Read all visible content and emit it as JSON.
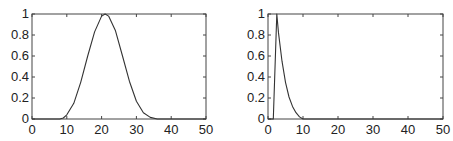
{
  "chart_data": [
    {
      "type": "line",
      "title": "",
      "xlabel": "",
      "ylabel": "",
      "xlim": [
        0,
        50
      ],
      "ylim": [
        0,
        1
      ],
      "xticks": [
        0,
        10,
        20,
        30,
        40,
        50
      ],
      "yticks": [
        0,
        0.2,
        0.4,
        0.6,
        0.8,
        1
      ],
      "xtick_labels": [
        "0",
        "10",
        "20",
        "30",
        "40",
        "50"
      ],
      "ytick_labels": [
        "0",
        "0.2",
        "0.4",
        "0.6",
        "0.8",
        "1"
      ],
      "grid": false,
      "legend": null,
      "series": [
        {
          "name": "curve",
          "color": "#333333",
          "x": [
            0,
            5,
            8,
            9,
            10,
            12,
            14,
            16,
            18,
            20,
            21,
            22,
            24,
            26,
            28,
            30,
            32,
            34,
            36,
            40,
            45,
            50
          ],
          "y": [
            0,
            0,
            0,
            0.01,
            0.04,
            0.15,
            0.35,
            0.6,
            0.83,
            0.98,
            1.0,
            0.98,
            0.84,
            0.6,
            0.36,
            0.17,
            0.06,
            0.015,
            0,
            0,
            0,
            0
          ]
        }
      ]
    },
    {
      "type": "line",
      "title": "",
      "xlabel": "",
      "ylabel": "",
      "xlim": [
        0,
        50
      ],
      "ylim": [
        0,
        1
      ],
      "xticks": [
        0,
        10,
        20,
        30,
        40,
        50
      ],
      "yticks": [
        0,
        0.2,
        0.4,
        0.6,
        0.8,
        1
      ],
      "xtick_labels": [
        "0",
        "10",
        "20",
        "30",
        "40",
        "50"
      ],
      "ytick_labels": [
        "0",
        "0.2",
        "0.4",
        "0.6",
        "0.8",
        "1"
      ],
      "grid": false,
      "legend": null,
      "series": [
        {
          "name": "curve",
          "color": "#333333",
          "x": [
            0,
            1.5,
            2.5,
            3,
            4,
            5,
            6,
            7,
            8,
            9,
            10,
            20,
            30,
            40,
            50
          ],
          "y": [
            0,
            0,
            1.0,
            0.82,
            0.55,
            0.35,
            0.21,
            0.12,
            0.06,
            0.02,
            0,
            0,
            0,
            0,
            0
          ]
        }
      ]
    }
  ]
}
